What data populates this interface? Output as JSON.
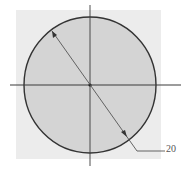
{
  "diagram": {
    "title": "",
    "shape": "circle",
    "dimension_label": "20",
    "colors": {
      "background_panel": "#ececec",
      "circle_fill": "#d4d4d4",
      "circle_stroke": "#333333",
      "axis_stroke": "#3a3a3a",
      "dimension_stroke": "#555555"
    }
  }
}
